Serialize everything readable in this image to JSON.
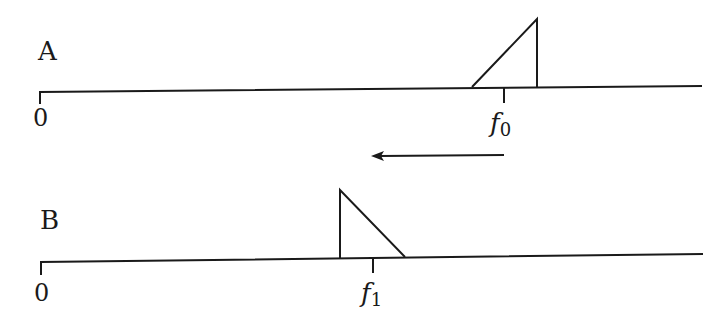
{
  "diagram": {
    "panel_a": {
      "label": "A",
      "origin_label": "0",
      "freq_label_base": "f",
      "freq_label_sub": "0",
      "spectrum_shape": "right-angled triangle rising to the right (peak at upper edge)"
    },
    "arrow": {
      "direction": "left",
      "meaning": "frequency shift from A to B"
    },
    "panel_b": {
      "label": "B",
      "origin_label": "0",
      "freq_label_base": "f",
      "freq_label_sub": "1",
      "spectrum_shape": "right-angled triangle falling to the right (peak at lower edge, mirrored)"
    },
    "colors": {
      "stroke": "#1a1a1a",
      "background": "#ffffff"
    }
  }
}
